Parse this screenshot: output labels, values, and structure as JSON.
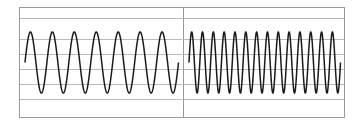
{
  "figure": {
    "background_color": "#ffffff",
    "frame_color": "#9a9a9a",
    "gridline_color": "#b9b9b9",
    "trace_color": "#1a1a1a"
  },
  "panels": [
    {
      "id": "panel-left",
      "name": "left-waveform-panel",
      "label": "",
      "plot_x_start": 5,
      "plot_x_end": 160,
      "gridlines_y": [
        10,
        31,
        46,
        61,
        76,
        91
      ]
    },
    {
      "id": "panel-right",
      "name": "right-waveform-panel",
      "label": "",
      "plot_x_start": 5,
      "plot_x_end": 157,
      "gridlines_y": [
        10,
        31,
        46,
        61,
        76,
        91
      ]
    }
  ],
  "chart_data": [
    {
      "type": "line",
      "title": "",
      "subtitle": "",
      "xlabel": "",
      "ylabel": "",
      "grid": true,
      "legend": "none",
      "panel": "left",
      "waveform": "sine",
      "cycles": 7,
      "amplitude": 1.0,
      "phase_deg": 0,
      "baseline": 0,
      "xlim": [
        0,
        7
      ],
      "ylim": [
        -1.25,
        1.25
      ],
      "peak_y_px": 32,
      "trough_y_px": 93,
      "tick_labels_x": [],
      "tick_labels_y": [],
      "annotations": []
    },
    {
      "type": "line",
      "title": "",
      "subtitle": "",
      "xlabel": "",
      "ylabel": "",
      "grid": true,
      "legend": "none",
      "panel": "right",
      "waveform": "sine",
      "cycles": 14,
      "amplitude": 1.0,
      "phase_deg": 0,
      "baseline": 0,
      "xlim": [
        0,
        14
      ],
      "ylim": [
        -1.25,
        1.25
      ],
      "peak_y_px": 32,
      "trough_y_px": 93,
      "tick_labels_x": [],
      "tick_labels_y": [],
      "annotations": []
    }
  ]
}
